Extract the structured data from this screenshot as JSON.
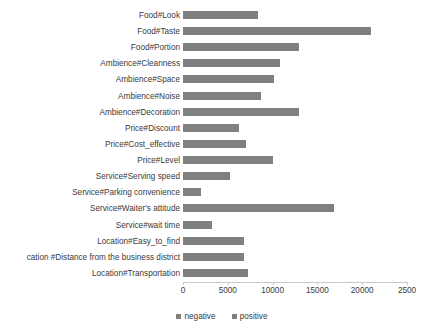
{
  "chart_data": {
    "type": "bar",
    "orientation": "horizontal",
    "title": "",
    "xlabel": "",
    "ylabel": "",
    "xlim": [
      0,
      25000
    ],
    "xticks": [
      0,
      5000,
      10000,
      15000,
      20000,
      25000
    ],
    "xtick_labels": [
      "0",
      "5000",
      "10000",
      "15000",
      "20000",
      "2500"
    ],
    "grid": false,
    "legend_position": "bottom",
    "legend": [
      "negative",
      "positive"
    ],
    "bar_color": "#808080",
    "categories": [
      "Food#Look",
      "Food#Taste",
      "Food#Portion",
      "Ambience#Cleanness",
      "Ambience#Space",
      "Ambience#Noise",
      "Ambience#Decoration",
      "Price#Discount",
      "Price#Cost_effective",
      "Price#Level",
      "Service#Serving speed",
      "Service#Parking convenience",
      "Service#Waiter's attitude",
      "Service#wait time",
      "Location#Easy_to_find",
      "cation #Distance from the business district",
      "Location#Transportation"
    ],
    "series": [
      {
        "name": "positive",
        "values": [
          8400,
          21000,
          12900,
          10800,
          10200,
          8700,
          13000,
          6200,
          7000,
          10000,
          5200,
          2000,
          16800,
          3200,
          6800,
          6800,
          7300
        ]
      }
    ]
  },
  "legend": {
    "negative_label": "negative",
    "positive_label": "positive"
  }
}
